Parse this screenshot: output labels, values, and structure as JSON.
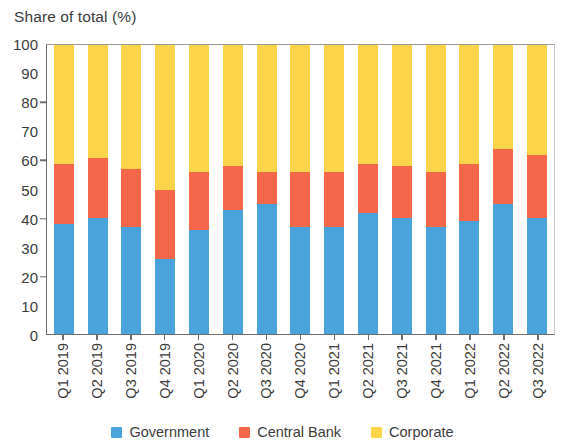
{
  "chart_data": {
    "type": "bar",
    "subtype": "stacked-bar-100-percent",
    "title": "Share of total (%)",
    "xlabel": "",
    "ylabel": "Share of total (%)",
    "ylim": [
      0,
      100
    ],
    "ytick_step": 10,
    "yticks": [
      100,
      90,
      80,
      70,
      60,
      50,
      40,
      30,
      20,
      10,
      0
    ],
    "grid": false,
    "legend_position": "bottom-center",
    "categories": [
      "Q1 2019",
      "Q2 2019",
      "Q3 2019",
      "Q4 2019",
      "Q1 2020",
      "Q2 2020",
      "Q3 2020",
      "Q4 2020",
      "Q1 2021",
      "Q2 2021",
      "Q3 2021",
      "Q4 2021",
      "Q1 2022",
      "Q2 2022",
      "Q3 2022"
    ],
    "series": [
      {
        "name": "Government",
        "color": "#4ba3dc",
        "values": [
          38,
          40,
          37,
          26,
          36,
          43,
          45,
          37,
          37,
          42,
          40,
          37,
          39,
          45,
          40
        ]
      },
      {
        "name": "Central Bank",
        "color": "#f4674a",
        "values": [
          21,
          21,
          20,
          24,
          20,
          15,
          11,
          19,
          19,
          17,
          18,
          19,
          20,
          19,
          22
        ]
      },
      {
        "name": "Corporate",
        "color": "#fbd44a",
        "values": [
          41,
          39,
          43,
          50,
          44,
          42,
          44,
          44,
          44,
          41,
          42,
          44,
          41,
          36,
          38
        ]
      }
    ],
    "cumulative_tops": {
      "government": [
        38,
        40,
        37,
        26,
        36,
        43,
        45,
        37,
        37,
        42,
        40,
        37,
        39,
        45,
        40
      ],
      "central_bank": [
        59,
        61,
        57,
        50,
        56,
        58,
        56,
        56,
        56,
        59,
        58,
        56,
        59,
        64,
        62
      ],
      "corporate": [
        100,
        100,
        100,
        100,
        100,
        100,
        100,
        100,
        100,
        100,
        100,
        100,
        100,
        100,
        100
      ]
    }
  },
  "legend": {
    "items": [
      {
        "label": "Government",
        "color": "#4ba3dc"
      },
      {
        "label": "Central Bank",
        "color": "#f4674a"
      },
      {
        "label": "Corporate",
        "color": "#fbd44a"
      }
    ]
  }
}
